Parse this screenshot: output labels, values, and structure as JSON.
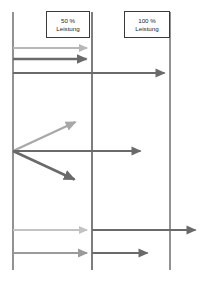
{
  "diagram": {
    "background_color": "#ffffff",
    "axes": {
      "name": "vertical-guide-lines",
      "color": "#6e6e6e",
      "top": 12,
      "bottom": 270,
      "lines": [
        {
          "name": "start-axis",
          "x": 13,
          "label": ""
        },
        {
          "name": "fifty-percent-axis",
          "x": 92,
          "label": "50 %"
        },
        {
          "name": "hundred-percent-axis",
          "x": 170,
          "label": "100 %"
        }
      ]
    },
    "labels": [
      {
        "name": "label-50-percent",
        "line1": "50 %",
        "line2": "Leistung",
        "x": 92
      },
      {
        "name": "label-100-percent",
        "line1": "100 %",
        "line2": "Leistung",
        "x": 170
      }
    ],
    "colors": {
      "light_gray": "#b7b7b7",
      "medium_gray": "#8d8d8d",
      "dark_gray": "#5f5f5f",
      "axis_gray": "#6e6e6e",
      "text": "#262626",
      "box_border": "#3a3a3a"
    },
    "arrows": [
      {
        "name": "arrow-top-light-to-50",
        "group": "top",
        "x1": 13,
        "y1": 48,
        "x2": 91,
        "y2": 48,
        "color": "#b7b7b7",
        "width": 2.0,
        "ends_at": "50 %"
      },
      {
        "name": "arrow-top-dark-to-50",
        "group": "top",
        "x1": 13,
        "y1": 59,
        "x2": 91,
        "y2": 59,
        "color": "#6a6a6a",
        "width": 2.4,
        "ends_at": "50 %"
      },
      {
        "name": "arrow-top-dark-to-100",
        "group": "top",
        "x1": 13,
        "y1": 73,
        "x2": 169,
        "y2": 73,
        "color": "#6a6a6a",
        "width": 2.2,
        "ends_at": "100 %"
      },
      {
        "name": "arrow-fan-up-light",
        "group": "fan",
        "x1": 13,
        "y1": 151,
        "x2": 79,
        "y2": 120,
        "color": "#a8a8a8",
        "width": 2.4,
        "ends_at": "below 50 %"
      },
      {
        "name": "arrow-fan-middle-dark",
        "group": "fan",
        "x1": 13,
        "y1": 151,
        "x2": 145,
        "y2": 151,
        "color": "#6a6a6a",
        "width": 2.2,
        "ends_at": "between 50 % and 100 %"
      },
      {
        "name": "arrow-fan-down-dark",
        "group": "fan",
        "x1": 13,
        "y1": 151,
        "x2": 79,
        "y2": 182,
        "color": "#6a6a6a",
        "width": 2.6,
        "ends_at": "below 50 %"
      },
      {
        "name": "arrow-bottom-light-to-50",
        "group": "bottom",
        "x1": 13,
        "y1": 230,
        "x2": 91,
        "y2": 230,
        "color": "#c2c2c2",
        "width": 2.0,
        "ends_at": "50 %"
      },
      {
        "name": "arrow-bottom-dark-past-100",
        "group": "bottom",
        "x1": 92,
        "y1": 230,
        "x2": 200,
        "y2": 230,
        "color": "#6a6a6a",
        "width": 2.2,
        "ends_at": "beyond 100 %"
      },
      {
        "name": "arrow-bottom-medium-to-50",
        "group": "bottom",
        "x1": 13,
        "y1": 253,
        "x2": 91,
        "y2": 253,
        "color": "#9a9a9a",
        "width": 2.2,
        "ends_at": "50 %"
      },
      {
        "name": "arrow-bottom-dark-to-mid",
        "group": "bottom",
        "x1": 92,
        "y1": 253,
        "x2": 152,
        "y2": 253,
        "color": "#6a6a6a",
        "width": 2.2,
        "ends_at": "between 50 % and 100 %"
      }
    ]
  }
}
